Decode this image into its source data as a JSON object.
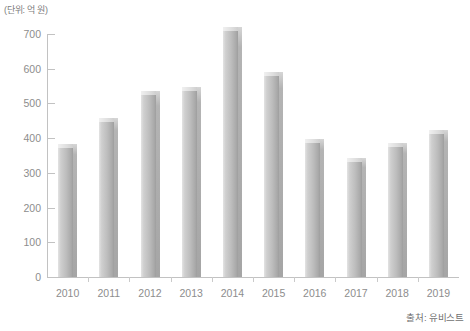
{
  "unit_label": "(단위: 억 원)",
  "source_note": "출처: 유비스트",
  "chart_data": {
    "type": "bar",
    "title": "",
    "xlabel": "",
    "ylabel": "",
    "unit": "(단위: 억 원)",
    "source": "출처: 유비스트",
    "categories": [
      "2010",
      "2011",
      "2012",
      "2013",
      "2014",
      "2015",
      "2016",
      "2017",
      "2018",
      "2019"
    ],
    "values": [
      372,
      447,
      523,
      536,
      710,
      578,
      386,
      332,
      375,
      412
    ],
    "ylim": [
      0,
      700
    ],
    "yticks": [
      0,
      100,
      200,
      300,
      400,
      500,
      600,
      700
    ],
    "ytick_labels": [
      "0",
      "100",
      "200",
      "300",
      "400",
      "500",
      "600",
      "700"
    ],
    "grid": false,
    "legend": null,
    "bar_color": "#bdbdbd",
    "bar_top_color": "#e8e8e8",
    "axis_color": "#c2c2c2",
    "text_color": "#8d8d8d"
  }
}
